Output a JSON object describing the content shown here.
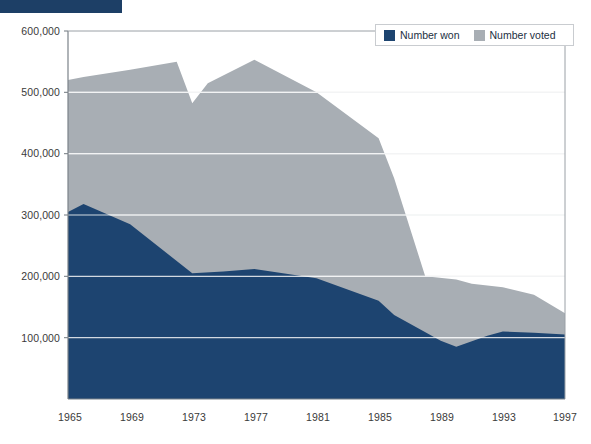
{
  "banner": {
    "label": ""
  },
  "legend": {
    "position": "top-right",
    "items": [
      {
        "label": "Number won",
        "color": "#1d4470",
        "icon": "square-swatch-icon"
      },
      {
        "label": "Number voted",
        "color": "#a8aeb4",
        "icon": "square-swatch-icon"
      }
    ]
  },
  "axes": {
    "y_ticks": [
      "100,000",
      "200,000",
      "300,000",
      "400,000",
      "500,000",
      "600,000"
    ],
    "x_ticks": [
      "1965",
      "1969",
      "1973",
      "1977",
      "1981",
      "1985",
      "1989",
      "1993",
      "1997"
    ]
  },
  "chart_data": {
    "type": "area",
    "title": "",
    "subtitle": "",
    "xlabel": "",
    "ylabel": "",
    "xlim": [
      1965,
      1997
    ],
    "ylim": [
      0,
      600000
    ],
    "grid": true,
    "gridlines_y": [
      100000,
      200000,
      300000,
      400000,
      500000
    ],
    "legend_position": "top-right",
    "stacking": "overlaid",
    "categories": [
      "1965",
      "1969",
      "1973",
      "1977",
      "1981",
      "1985",
      "1989",
      "1993",
      "1997"
    ],
    "series": [
      {
        "name": "Number voted",
        "color": "#a8aeb4",
        "x": [
          1965,
          1966,
          1969,
          1972,
          1973,
          1974,
          1977,
          1981,
          1985,
          1986,
          1988,
          1990,
          1991,
          1993,
          1995,
          1997
        ],
        "values": [
          520000,
          525000,
          537000,
          550000,
          482000,
          515000,
          553000,
          500000,
          425000,
          360000,
          200000,
          195000,
          188000,
          182000,
          170000,
          140000
        ]
      },
      {
        "name": "Number won",
        "color": "#1d4470",
        "x": [
          1965,
          1966,
          1969,
          1973,
          1975,
          1977,
          1981,
          1985,
          1986,
          1989,
          1990,
          1992,
          1993,
          1995,
          1997
        ],
        "values": [
          305000,
          318000,
          285000,
          205000,
          208000,
          212000,
          197000,
          160000,
          137000,
          95000,
          85000,
          103000,
          110000,
          108000,
          105000
        ]
      }
    ],
    "annotations": [
      {
        "text": "dip at 1973",
        "x": 1973,
        "series": "Number voted",
        "value": 482000
      },
      {
        "text": "peak at 1977",
        "x": 1977,
        "series": "Number voted",
        "value": 553000
      }
    ]
  }
}
